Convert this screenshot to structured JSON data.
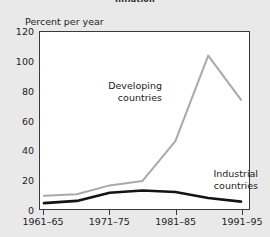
{
  "title": "Inflation",
  "axis": {
    "ylabel": "Percent per year",
    "yticks": [
      "0",
      "20",
      "40",
      "60",
      "80",
      "100",
      "120"
    ],
    "xticks": [
      "1961–65",
      "1971–75",
      "1981–85",
      "1991–95"
    ]
  },
  "annotations": {
    "developing_line1": "Developing",
    "developing_line2": "countries",
    "industrial_line1": "Industrial",
    "industrial_line2": "countries"
  },
  "colors": {
    "developing": "#a9a9a9",
    "industrial": "#141414",
    "frame": "#3a3a3a",
    "plot_bg": "#ffffff",
    "page_bg": "#e9e9e9"
  },
  "chart_data": {
    "type": "line",
    "title": "Inflation",
    "xlabel": "",
    "ylabel": "Percent per year",
    "categories": [
      "1961–65",
      "1966–70",
      "1971–75",
      "1976–80",
      "1981–85",
      "1986–90",
      "1991–95"
    ],
    "xtick_labels": [
      "1961–65",
      "1971–75",
      "1981–85",
      "1991–95"
    ],
    "xtick_categories": [
      "1961–65",
      "1971–75",
      "1981–85",
      "1991–95"
    ],
    "ylim": [
      0,
      120
    ],
    "ytick_values": [
      0,
      20,
      40,
      60,
      80,
      100,
      120
    ],
    "grid": false,
    "legend": "inline-annotations",
    "series": [
      {
        "name": "Developing countries",
        "color": "#a9a9a9",
        "values": [
          9,
          10,
          16,
          19,
          46,
          104,
          74
        ]
      },
      {
        "name": "Industrial countries",
        "color": "#141414",
        "values": [
          4,
          5.5,
          11,
          12.5,
          11.5,
          7.5,
          5
        ]
      }
    ]
  }
}
